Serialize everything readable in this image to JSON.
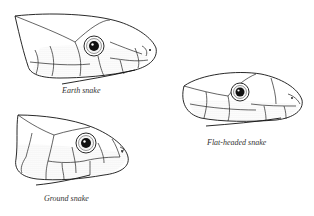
{
  "figure": {
    "type": "comparative illustration of snake head scalation",
    "panels": [
      {
        "id": "earth",
        "caption": "Earth snake",
        "position": "top-left"
      },
      {
        "id": "flat-headed",
        "caption": "Flat-headed snake",
        "position": "middle-right"
      },
      {
        "id": "ground",
        "caption": "Ground snake",
        "position": "bottom-left"
      }
    ]
  }
}
